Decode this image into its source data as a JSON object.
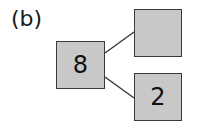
{
  "figure": {
    "label": "(b)",
    "whole": {
      "value": "8"
    },
    "parts": [
      {
        "position": "top",
        "value": ""
      },
      {
        "position": "bottom",
        "value": "2"
      }
    ]
  },
  "colors": {
    "box_fill": "#c8c8c8",
    "box_border": "#3a3a3a",
    "line": "#3a3a3a"
  }
}
